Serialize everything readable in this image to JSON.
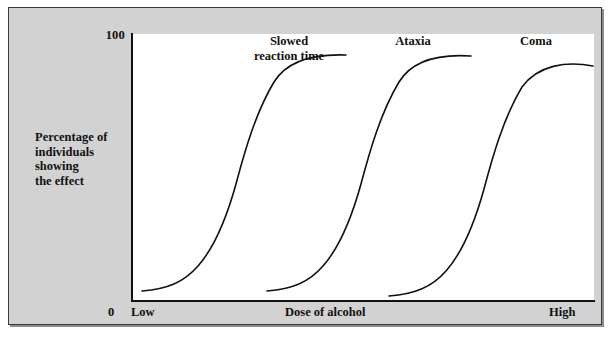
{
  "figure": {
    "background_color": "#d2d2d2",
    "plot_background_color": "#ffffff",
    "axis_color": "#111111"
  },
  "axes": {
    "y_tick_top": "100",
    "y_tick_bottom": "0",
    "y_title_lines": [
      "Percentage of",
      "individuals",
      "showing",
      "the effect"
    ],
    "x_title": "Dose of alcohol",
    "x_tick_low": "Low",
    "x_tick_high": "High"
  },
  "chart_data": {
    "type": "line",
    "title": "",
    "subtitle": "",
    "xlabel": "Dose of alcohol",
    "ylabel": "Percentage of individuals showing the effect",
    "xlim": [
      0,
      100
    ],
    "ylim": [
      0,
      100
    ],
    "xtick_labels": [
      "Low",
      "High"
    ],
    "ytick_labels": [
      "0",
      "100"
    ],
    "grid": false,
    "legend_position": "inline-annotations",
    "annotations": [
      {
        "text": "Slowed reaction time",
        "x": 26,
        "y": 100
      },
      {
        "text": "Ataxia",
        "x": 57,
        "y": 100
      },
      {
        "text": "Coma",
        "x": 85,
        "y": 100
      }
    ],
    "series": [
      {
        "name": "Slowed reaction time",
        "shape": "sigmoid",
        "x": [
          2,
          6,
          10,
          14,
          18,
          22,
          26,
          30,
          34,
          38,
          42,
          46
        ],
        "values": [
          3,
          5,
          8,
          13,
          22,
          36,
          52,
          68,
          80,
          88,
          92,
          94
        ]
      },
      {
        "name": "Ataxia",
        "shape": "sigmoid",
        "x": [
          29,
          33,
          37,
          41,
          45,
          49,
          53,
          57,
          61,
          65,
          69,
          73
        ],
        "values": [
          3,
          5,
          8,
          13,
          22,
          36,
          52,
          68,
          80,
          88,
          92,
          94
        ]
      },
      {
        "name": "Coma",
        "shape": "sigmoid",
        "x": [
          56,
          60,
          64,
          68,
          72,
          76,
          80,
          84,
          88,
          92,
          96,
          100
        ],
        "values": [
          2,
          4,
          7,
          12,
          20,
          33,
          48,
          63,
          75,
          83,
          88,
          90
        ]
      }
    ]
  }
}
